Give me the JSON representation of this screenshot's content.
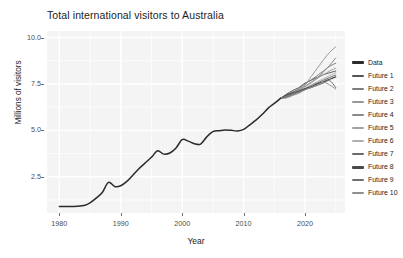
{
  "chart_data": {
    "type": "line",
    "title": "Total international visitors to Australia",
    "xlabel": "Year",
    "ylabel": "Millions of visitors",
    "xlim": [
      1978,
      2026.5
    ],
    "ylim": [
      0.55,
      10.35
    ],
    "xticks": [
      1980,
      1990,
      2000,
      2010,
      2020
    ],
    "xticklabels": [
      "1980",
      "1990",
      "2000",
      "2010",
      "2020"
    ],
    "yticks": [
      2.5,
      5.0,
      7.5,
      10.0
    ],
    "yticklabels": [
      "2.5",
      "5.0",
      "7.5",
      "10.0"
    ],
    "grid": true,
    "grid_color": "#ffffff",
    "panel_background": "#f4f4f4",
    "legend_position": "right",
    "legend_title": "",
    "x": [
      1980,
      1981,
      1982,
      1983,
      1984,
      1985,
      1986,
      1987,
      1988,
      1989,
      1990,
      1991,
      1992,
      1993,
      1994,
      1995,
      1996,
      1997,
      1998,
      1999,
      2000,
      2001,
      2002,
      2003,
      2004,
      2005,
      2006,
      2007,
      2008,
      2009,
      2010,
      2011,
      2012,
      2013,
      2014,
      2015,
      2016
    ],
    "series": [
      {
        "name": "Data",
        "color": "#2b2b2b",
        "width": 1.5,
        "x": [
          1980,
          1981,
          1982,
          1983,
          1984,
          1985,
          1986,
          1987,
          1988,
          1989,
          1990,
          1991,
          1992,
          1993,
          1994,
          1995,
          1996,
          1997,
          1998,
          1999,
          2000,
          2001,
          2002,
          2003,
          2004,
          2005,
          2006,
          2007,
          2008,
          2009,
          2010,
          2011,
          2012,
          2013,
          2014,
          2015,
          2016
        ],
        "values": [
          0.9,
          0.9,
          0.9,
          0.92,
          0.95,
          1.1,
          1.35,
          1.65,
          2.2,
          1.98,
          2.02,
          2.25,
          2.6,
          2.95,
          3.25,
          3.55,
          3.9,
          3.72,
          3.78,
          4.05,
          4.5,
          4.42,
          4.28,
          4.26,
          4.65,
          4.93,
          4.98,
          5.02,
          5.0,
          4.97,
          5.05,
          5.3,
          5.55,
          5.85,
          6.2,
          6.45,
          6.72
        ]
      },
      {
        "name": "Future 1",
        "color": "#555555",
        "width": 1.0,
        "x": [
          2016,
          2017,
          2018,
          2019,
          2020,
          2021,
          2022,
          2023,
          2024,
          2025
        ],
        "values": [
          6.72,
          6.95,
          7.15,
          7.3,
          7.55,
          7.7,
          7.85,
          8.0,
          8.1,
          8.2
        ]
      },
      {
        "name": "Future 2",
        "color": "#7d7d7d",
        "width": 1.0,
        "x": [
          2016,
          2017,
          2018,
          2019,
          2020,
          2021,
          2022,
          2023,
          2024,
          2025
        ],
        "values": [
          6.72,
          6.9,
          7.05,
          7.25,
          7.5,
          7.72,
          7.95,
          8.2,
          8.45,
          8.62
        ]
      },
      {
        "name": "Future 3",
        "color": "#999999",
        "width": 1.0,
        "x": [
          2016,
          2017,
          2018,
          2019,
          2020,
          2021,
          2022,
          2023,
          2024,
          2025
        ],
        "values": [
          6.72,
          6.82,
          7.0,
          7.2,
          7.45,
          7.9,
          8.35,
          8.8,
          9.2,
          9.5
        ]
      },
      {
        "name": "Future 4",
        "color": "#8a8a8a",
        "width": 1.0,
        "x": [
          2016,
          2017,
          2018,
          2019,
          2020,
          2021,
          2022,
          2023,
          2024,
          2025
        ],
        "values": [
          6.72,
          6.88,
          7.08,
          7.18,
          7.38,
          7.6,
          7.82,
          8.15,
          8.5,
          8.9
        ]
      },
      {
        "name": "Future 5",
        "color": "#a3a3a3",
        "width": 1.0,
        "x": [
          2016,
          2017,
          2018,
          2019,
          2020,
          2021,
          2022,
          2023,
          2024,
          2025
        ],
        "values": [
          6.72,
          6.8,
          6.95,
          7.15,
          7.35,
          7.55,
          7.8,
          8.0,
          8.2,
          8.35
        ]
      },
      {
        "name": "Future 6",
        "color": "#b0b0b0",
        "width": 1.0,
        "x": [
          2016,
          2017,
          2018,
          2019,
          2020,
          2021,
          2022,
          2023,
          2024,
          2025
        ],
        "values": [
          6.72,
          6.85,
          7.0,
          7.1,
          7.28,
          7.45,
          7.62,
          7.78,
          7.95,
          8.1
        ]
      },
      {
        "name": "Future 7",
        "color": "#6b6b6b",
        "width": 1.0,
        "x": [
          2016,
          2017,
          2018,
          2019,
          2020,
          2021,
          2022,
          2023,
          2024,
          2025
        ],
        "values": [
          6.72,
          6.78,
          6.92,
          7.05,
          7.22,
          7.4,
          7.55,
          7.7,
          7.85,
          7.98
        ]
      },
      {
        "name": "Future 8",
        "color": "#4a4a4a",
        "width": 1.2,
        "x": [
          2016,
          2017,
          2018,
          2019,
          2020,
          2021,
          2022,
          2023,
          2024,
          2025
        ],
        "values": [
          6.72,
          6.9,
          7.02,
          7.12,
          7.25,
          7.35,
          7.5,
          7.62,
          7.75,
          7.88
        ]
      },
      {
        "name": "Future 9",
        "color": "#707070",
        "width": 1.0,
        "x": [
          2016,
          2017,
          2018,
          2019,
          2020,
          2021,
          2022,
          2023,
          2024,
          2025
        ],
        "values": [
          6.72,
          6.84,
          6.98,
          7.08,
          7.2,
          7.3,
          7.42,
          7.55,
          7.68,
          7.3
        ]
      },
      {
        "name": "Future 10",
        "color": "#8f8f8f",
        "width": 1.0,
        "x": [
          2016,
          2017,
          2018,
          2019,
          2020,
          2021,
          2022,
          2023,
          2024,
          2025
        ],
        "values": [
          6.72,
          6.75,
          6.88,
          7.0,
          7.18,
          7.3,
          7.45,
          7.58,
          7.45,
          7.22
        ]
      }
    ]
  },
  "legend": {
    "items": [
      {
        "label": "Data",
        "color": "#2b2b2b",
        "thick": true
      },
      {
        "label": "Future 1",
        "color": "#555555",
        "thick": false
      },
      {
        "label": "Future 2",
        "color": "#7d7d7d",
        "thick": false
      },
      {
        "label": "Future 3",
        "color": "#999999",
        "thick": false
      },
      {
        "label": "Future 4",
        "color": "#8a8a8a",
        "thick": false
      },
      {
        "label": "Future 5",
        "color": "#a3a3a3",
        "thick": false
      },
      {
        "label": "Future 6",
        "color": "#b0b0b0",
        "thick": false
      },
      {
        "label": "Future 7",
        "color": "#6b6b6b",
        "thick": false
      },
      {
        "label": "Future 8",
        "color": "#4a4a4a",
        "thick": true
      },
      {
        "label": "Future 9",
        "color": "#707070",
        "thick": false
      },
      {
        "label": "Future 10",
        "color": "#8f8f8f",
        "thick": false
      }
    ]
  }
}
